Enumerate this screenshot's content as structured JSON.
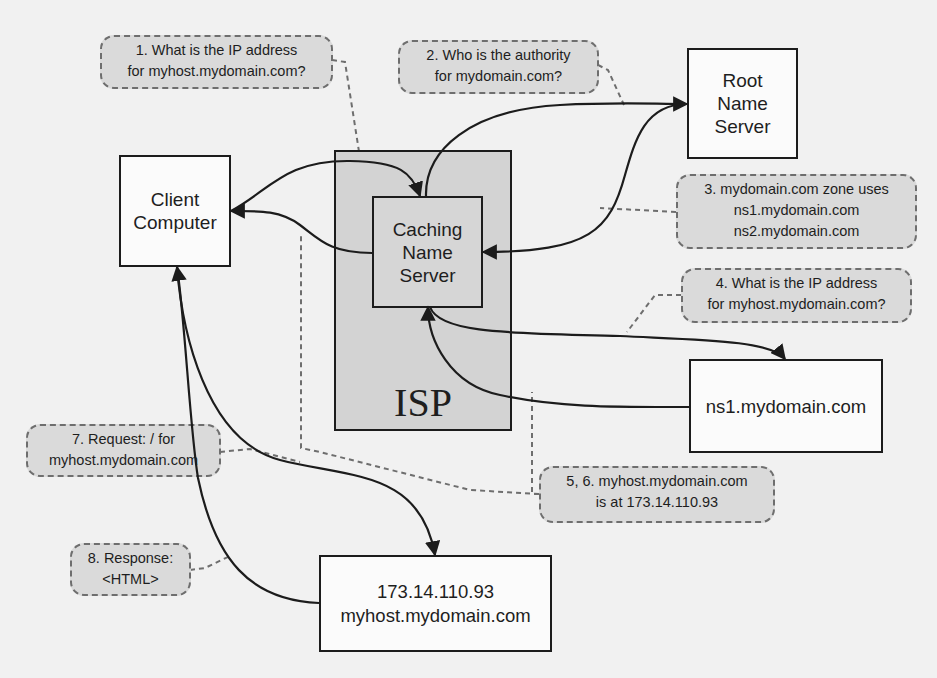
{
  "diagram": {
    "colors": {
      "background": "#f1f1f1",
      "node_fill": "#fbfbfb",
      "isp_fill": "#d3d3d3",
      "bubble_fill": "#dadada",
      "bubble_border": "#6e6e6e",
      "line": "#1c1c1c"
    },
    "nodes": {
      "client": {
        "label": "Client\nComputer"
      },
      "isp": {
        "label": "ISP"
      },
      "caching_ns": {
        "label": "Caching\nName\nServer"
      },
      "root_ns": {
        "label": "Root\nName\nServer"
      },
      "ns1": {
        "label": "ns1.mydomain.com"
      },
      "host": {
        "ip": "173.14.110.93",
        "hostname": "myhost.mydomain.com"
      }
    },
    "steps": [
      {
        "id": "1",
        "text": "1. What is the IP address\nfor myhost.mydomain.com?"
      },
      {
        "id": "2",
        "text": "2. Who is the authority\nfor mydomain.com?"
      },
      {
        "id": "3",
        "text": "3. mydomain.com zone uses\nns1.mydomain.com\nns2.mydomain.com"
      },
      {
        "id": "4",
        "text": "4. What is the IP address\nfor myhost.mydomain.com?"
      },
      {
        "id": "5-6",
        "text": "5, 6. myhost.mydomain.com\nis at 173.14.110.93"
      },
      {
        "id": "7",
        "text": "7. Request: / for\nmyhost.mydomain.com"
      },
      {
        "id": "8",
        "text": "8. Response:\n<HTML>"
      }
    ],
    "edges": [
      {
        "from": "client",
        "to": "caching_ns",
        "step": "1"
      },
      {
        "from": "caching_ns",
        "to": "root_ns",
        "step": "2"
      },
      {
        "from": "root_ns",
        "to": "caching_ns",
        "step": "3"
      },
      {
        "from": "caching_ns",
        "to": "ns1",
        "step": "4"
      },
      {
        "from": "ns1",
        "to": "caching_ns",
        "step": "5"
      },
      {
        "from": "caching_ns",
        "to": "client",
        "step": "6"
      },
      {
        "from": "client",
        "to": "host",
        "step": "7"
      },
      {
        "from": "host",
        "to": "client",
        "step": "8"
      }
    ]
  }
}
